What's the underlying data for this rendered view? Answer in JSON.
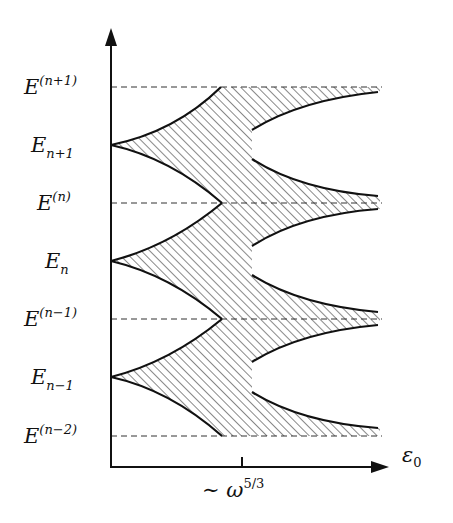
{
  "diagram": {
    "type": "energy-band-diagram",
    "y_axis": {
      "levels": [
        {
          "id": "E_np1_sup",
          "base": "E",
          "script": "(n+1)",
          "script_type": "superscript",
          "y": 87,
          "dashed": true
        },
        {
          "id": "E_np1_sub",
          "base": "E",
          "script": "n+1",
          "script_type": "subscript",
          "y": 145,
          "dashed": false
        },
        {
          "id": "E_n_sup",
          "base": "E",
          "script": "(n)",
          "script_type": "superscript",
          "y": 203,
          "dashed": true
        },
        {
          "id": "E_n_sub",
          "base": "E",
          "script": "n",
          "script_type": "subscript",
          "y": 261,
          "dashed": false
        },
        {
          "id": "E_nm1_sup",
          "base": "E",
          "script": "(n−1)",
          "script_type": "superscript",
          "y": 319,
          "dashed": true
        },
        {
          "id": "E_nm1_sub",
          "base": "E",
          "script": "n−1",
          "script_type": "subscript",
          "y": 377,
          "dashed": false
        },
        {
          "id": "E_nm2_sup",
          "base": "E",
          "script": "(n−2)",
          "script_type": "superscript",
          "y": 436,
          "dashed": true
        }
      ]
    },
    "x_axis": {
      "label_base": "ε",
      "label_sub": "0",
      "tick_label_prefix": "∼ ω",
      "tick_label_sup": "5/3"
    },
    "regions": {
      "hatched": "allowed energy bands (hatched)",
      "threshold_tick": "~ω^(5/3)"
    },
    "colors": {
      "ink": "#111111",
      "hatch": "#555555",
      "dash": "#333333",
      "background": "#ffffff"
    }
  }
}
